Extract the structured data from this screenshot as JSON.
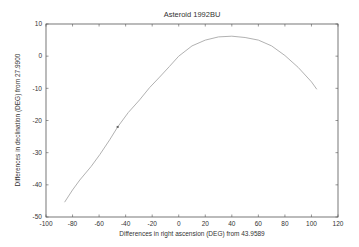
{
  "chart_data": {
    "type": "line",
    "title": "Asteroid  1992BU",
    "xlabel": "Differences in right ascension (DEG)  from  43.9589",
    "ylabel": "Differences in declination (DEG)  from  27.9900",
    "xlim": [
      -100,
      120
    ],
    "ylim": [
      -50,
      10
    ],
    "xticks": [
      -100,
      -80,
      -60,
      -40,
      -20,
      0,
      20,
      40,
      60,
      80,
      100,
      120
    ],
    "yticks": [
      -50,
      -40,
      -30,
      -20,
      -10,
      0,
      10
    ],
    "grid": false,
    "legend": null,
    "series": [
      {
        "name": "path",
        "x": [
          -86,
          -80,
          -74.5,
          -66,
          -59.5,
          -52,
          -46,
          -38,
          -29.5,
          -22,
          -14.4,
          -7,
          0,
          10,
          20,
          30,
          40,
          50,
          60,
          70,
          80,
          90,
          100,
          104
        ],
        "y": [
          -45.4,
          -41.6,
          -38.5,
          -34.3,
          -30.6,
          -26,
          -22,
          -17.5,
          -13.6,
          -9.8,
          -6.5,
          -3.2,
          0,
          3.2,
          5.0,
          6.0,
          6.2,
          5.8,
          5.0,
          3.2,
          0.2,
          -3.5,
          -8.0,
          -10.3
        ]
      }
    ],
    "annotations": [
      {
        "type": "marker",
        "x": -46,
        "y": -22,
        "label": ""
      }
    ]
  },
  "colors": {
    "line": "#a8a8a8",
    "axis": "#555555",
    "text": "#333333",
    "marker": "#666666"
  }
}
